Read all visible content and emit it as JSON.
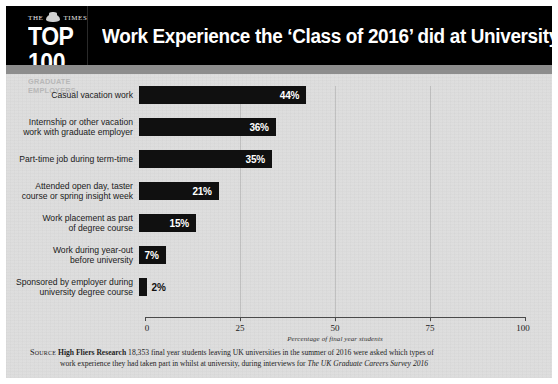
{
  "header": {
    "masthead": "THE TIMES",
    "crest_icon": "royal-crest-icon",
    "rank_label": "TOP 100",
    "sub_label": "GRADUATE EMPLOYERS",
    "title": "Work Experience the ‘Class of 2016’ did at University"
  },
  "chart_data": {
    "type": "bar",
    "orientation": "horizontal",
    "title": "Work Experience the ‘Class of 2016’ did at University",
    "categories": [
      "Casual vacation work",
      "Internship or other vacation\nwork with graduate employer",
      "Part-time job during term-time",
      "Attended open day, taster\ncourse or spring insight week",
      "Work placement as part\nof degree course",
      "Work during year-out\nbefore university",
      "Sponsored by employer during\nuniversity degree course"
    ],
    "values": [
      44,
      36,
      35,
      21,
      15,
      7,
      2
    ],
    "value_labels": [
      "44%",
      "36%",
      "35%",
      "21%",
      "15%",
      "7%",
      "2%"
    ],
    "label_inside": [
      true,
      true,
      true,
      true,
      true,
      true,
      false
    ],
    "xlabel": "Percentage of final year students",
    "ylabel": "",
    "xlim": [
      0,
      100
    ],
    "xticks": [
      0,
      25,
      50,
      75,
      100
    ],
    "xtick_labels": [
      "0",
      "25",
      "50",
      "75",
      "100"
    ],
    "grid": true,
    "legend": "none",
    "bar_color": "#101010",
    "background_color": "#dcdcdc"
  },
  "footer": {
    "source_word": "Source",
    "source_org": "High Fliers Research",
    "line1": "18,353 final year students leaving UK universities in the summer of 2016 were asked which types of",
    "line2_prefix": "work experience they had taken part in whilst at university, during interviews for ",
    "line2_italic": "The UK Graduate Careers Survey 2016"
  }
}
